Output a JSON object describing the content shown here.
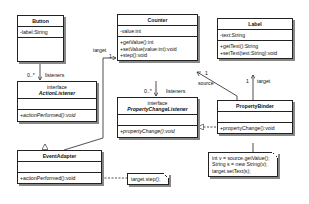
{
  "classes": {
    "button": {
      "name": "Button",
      "attributes": [
        "-label:String"
      ],
      "operations": []
    },
    "counter": {
      "name": "Counter",
      "attributes": [
        "-value:int"
      ],
      "operations": [
        "+getValue():int",
        "+setValue(value:int):void",
        "+step():void"
      ]
    },
    "label": {
      "name": "Label",
      "attributes": [
        "-text:String"
      ],
      "operations": [
        "+getText():String",
        "+setText(text:String):void"
      ]
    },
    "action_listener": {
      "stereotype": "interface",
      "name": "ActionListener",
      "operations": [
        "+actionPerformed():void"
      ]
    },
    "property_change_listener": {
      "stereotype": "interface",
      "name": "PropertyChangeListener",
      "operations": [
        "+propertyChange():void"
      ]
    },
    "property_binder": {
      "name": "PropertyBinder",
      "operations": [
        "+propertyChange():void"
      ]
    },
    "event_adapter": {
      "name": "EventAdapter",
      "operations": [
        "+actionPerformed():void"
      ]
    }
  },
  "notes": {
    "event_adapter_note": [
      "target.step();"
    ],
    "property_binder_note": [
      "int v = source.getValue();",
      "String s = new String(v);",
      "target.setText(s);"
    ]
  },
  "associations": {
    "button_listeners": {
      "multiplicity": "0..*",
      "role": "listeners"
    },
    "counter_listeners": {
      "multiplicity": "0..*",
      "role": "listeners"
    },
    "adapter_target": {
      "multiplicity": "1",
      "role": "target"
    },
    "binder_source": {
      "multiplicity": "1",
      "role": "source"
    },
    "binder_target": {
      "multiplicity": "1",
      "role": "target"
    }
  }
}
